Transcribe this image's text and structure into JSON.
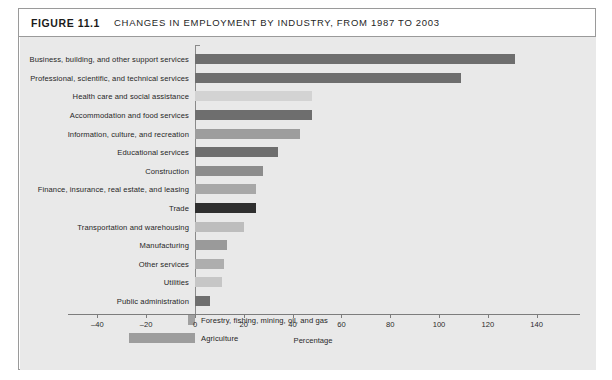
{
  "figure": {
    "tag": "FIGURE 11.1",
    "title": "CHANGES IN EMPLOYMENT BY INDUSTRY, FROM 1987 TO 2003"
  },
  "chart_data": {
    "type": "bar",
    "orientation": "horizontal",
    "title": "CHANGES IN EMPLOYMENT BY INDUSTRY, FROM 1987 TO 2003",
    "xlabel": "Percentage",
    "ylabel": "",
    "xlim": [
      -40,
      150
    ],
    "xticks": [
      -40,
      -20,
      0,
      20,
      40,
      60,
      80,
      100,
      120,
      140
    ],
    "xtick_labels": [
      "–40",
      "–20",
      "0",
      "20",
      "40",
      "60",
      "80",
      "100",
      "120",
      "140"
    ],
    "grid": false,
    "legend": "none",
    "categories": [
      "Business, building, and other support services",
      "Professional, scientific, and technical services",
      "Health care and social assistance",
      "Accommodation and food services",
      "Information, culture, and recreation",
      "Educational services",
      "Construction",
      "Finance, insurance, real estate, and leasing",
      "Trade",
      "Transportation and warehousing",
      "Manufacturing",
      "Other services",
      "Utilities",
      "Public administration",
      "Forestry, fishing, mining, oil, and gas",
      "Agriculture"
    ],
    "values": [
      131,
      109,
      48,
      48,
      43,
      34,
      28,
      25,
      25,
      20,
      13,
      12,
      11,
      6,
      -3,
      -27
    ],
    "bar_colors": [
      "#6e6e6e",
      "#6e6e6e",
      "#d3d3d3",
      "#6e6e6e",
      "#9d9d9d",
      "#6e6e6e",
      "#8c8c8c",
      "#a8a8a8",
      "#2f2f2f",
      "#bdbdbd",
      "#9a9a9a",
      "#aeaeae",
      "#c6c6c6",
      "#6e6e6e",
      "#a0a0a0",
      "#9d9d9d"
    ],
    "label_side": [
      "left",
      "left",
      "left",
      "left",
      "left",
      "left",
      "left",
      "left",
      "left",
      "left",
      "left",
      "left",
      "left",
      "left",
      "right",
      "right"
    ]
  },
  "colors": {
    "plot_background": "#e9e9e9",
    "frame_border": "#9a9a9a",
    "axis": "#7d7d7d",
    "text": "#262626"
  }
}
